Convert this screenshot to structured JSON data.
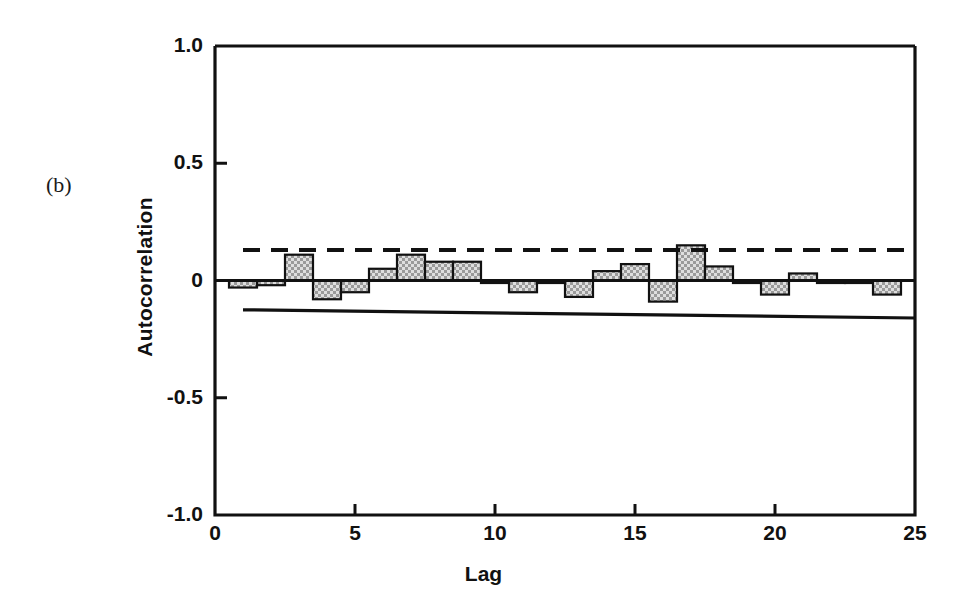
{
  "figure": {
    "panel_label": "(b)",
    "background_color": "#ffffff",
    "ink_color": "#111111",
    "bar_fill_color": "#cfcfcf",
    "bar_edge_color": "#111111"
  },
  "chart_data": {
    "type": "bar",
    "title": "",
    "subtitle": "",
    "xlabel": "Lag",
    "ylabel": "Autocorrelation",
    "xlim": [
      0,
      25
    ],
    "ylim": [
      -1.0,
      1.0
    ],
    "grid": false,
    "legend": null,
    "x_ticks": [
      0,
      5,
      10,
      15,
      20,
      25
    ],
    "x_tick_labels": [
      "0",
      "5",
      "10",
      "15",
      "20",
      "25"
    ],
    "y_ticks": [
      -1.0,
      -0.5,
      0,
      0.5,
      1.0
    ],
    "y_tick_labels": [
      "-1.0",
      "-0.5",
      "0",
      "0.5",
      "1.0"
    ],
    "categories": [
      1,
      2,
      3,
      4,
      5,
      6,
      7,
      8,
      9,
      10,
      11,
      12,
      13,
      14,
      15,
      16,
      17,
      18,
      19,
      20,
      21,
      22,
      23,
      24
    ],
    "values": [
      -0.03,
      -0.02,
      0.11,
      -0.08,
      -0.05,
      0.05,
      0.11,
      0.08,
      0.08,
      -0.01,
      -0.05,
      -0.01,
      -0.07,
      0.04,
      0.07,
      -0.09,
      0.15,
      0.06,
      -0.01,
      -0.06,
      0.03,
      -0.01,
      -0.005,
      -0.06
    ],
    "annotations": [
      {
        "name": "upper-confidence-limit",
        "style": "dashed",
        "value_start": 0.13,
        "value_end": 0.13,
        "x_start": 1,
        "x_end": 25
      },
      {
        "name": "lower-confidence-limit",
        "style": "solid",
        "value_start": -0.125,
        "value_end": -0.16,
        "x_start": 1,
        "x_end": 25
      },
      {
        "name": "zero-line",
        "style": "solid",
        "value_start": 0,
        "value_end": 0,
        "x_start": 0,
        "x_end": 25
      }
    ]
  }
}
